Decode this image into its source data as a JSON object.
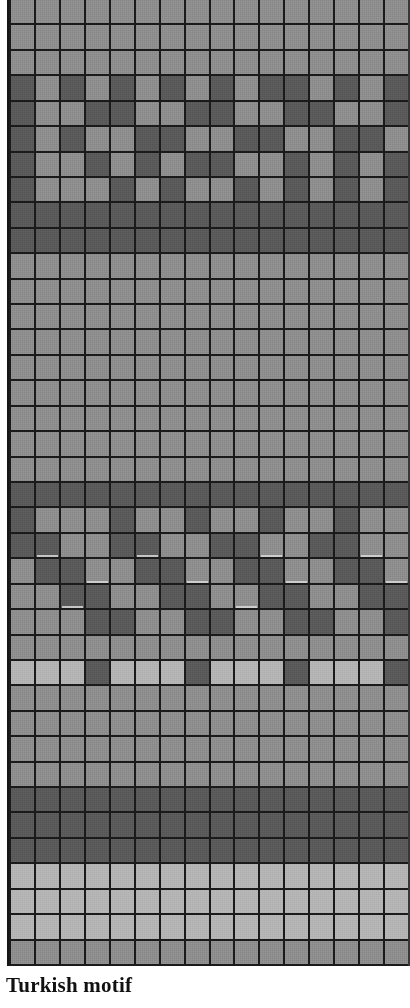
{
  "figure": {
    "caption": "Turkish motif",
    "kind": "knitting-colourwork-chart"
  },
  "chart_data": {
    "type": "heatmap",
    "title": "Turkish motif",
    "subtitle": "",
    "xlabel": "",
    "ylabel": "",
    "grid": true,
    "legend_position": "none",
    "columns": 16,
    "rows": 38,
    "cell_width_px": 25.2,
    "cell_height_px": 25.5,
    "grid_line_color": "#141414",
    "grid_line_width_px": 2,
    "value_labels": {
      "0": "light grey stitch",
      "1": "mid grey stitch",
      "2": "dark grey stitch"
    },
    "value_colors": {
      "0": "#b4b4b4",
      "1": "#8e8e8e",
      "2": "#5a5a5a"
    },
    "highlight_cells": [
      [
        21,
        1
      ],
      [
        21,
        5
      ],
      [
        21,
        10
      ],
      [
        21,
        14
      ],
      [
        22,
        3
      ],
      [
        22,
        7
      ],
      [
        22,
        11
      ],
      [
        22,
        15
      ],
      [
        23,
        2
      ],
      [
        23,
        9
      ]
    ],
    "row_bands": [
      {
        "from": 0,
        "to": 2,
        "name": "top plain mid band"
      },
      {
        "from": 3,
        "to": 8,
        "name": "upper chequer motif band"
      },
      {
        "from": 9,
        "to": 9,
        "name": "dark separator row"
      },
      {
        "from": 10,
        "to": 18,
        "name": "plain light field"
      },
      {
        "from": 19,
        "to": 24,
        "name": "lower stepped motif band"
      },
      {
        "from": 25,
        "to": 30,
        "name": "plain mid field"
      },
      {
        "from": 31,
        "to": 33,
        "name": "dark field"
      },
      {
        "from": 34,
        "to": 37,
        "name": "plain light base"
      }
    ],
    "matrix": [
      [
        1,
        1,
        1,
        1,
        1,
        1,
        1,
        1,
        1,
        1,
        1,
        1,
        1,
        1,
        1,
        1
      ],
      [
        1,
        1,
        1,
        1,
        1,
        1,
        1,
        1,
        1,
        1,
        1,
        1,
        1,
        1,
        1,
        1
      ],
      [
        1,
        1,
        1,
        1,
        1,
        1,
        1,
        1,
        1,
        1,
        1,
        1,
        1,
        1,
        1,
        1
      ],
      [
        2,
        1,
        2,
        1,
        2,
        1,
        2,
        1,
        2,
        1,
        2,
        2,
        1,
        2,
        1,
        2
      ],
      [
        2,
        1,
        1,
        2,
        2,
        1,
        1,
        2,
        2,
        1,
        1,
        2,
        2,
        1,
        1,
        2
      ],
      [
        2,
        1,
        2,
        1,
        1,
        2,
        2,
        1,
        1,
        2,
        2,
        1,
        1,
        2,
        2,
        1
      ],
      [
        2,
        1,
        1,
        2,
        1,
        2,
        1,
        2,
        2,
        1,
        1,
        2,
        1,
        2,
        1,
        2
      ],
      [
        2,
        1,
        1,
        1,
        2,
        1,
        2,
        1,
        1,
        2,
        1,
        2,
        1,
        2,
        1,
        2
      ],
      [
        2,
        2,
        2,
        2,
        2,
        2,
        2,
        2,
        2,
        2,
        2,
        2,
        2,
        2,
        2,
        2
      ],
      [
        2,
        2,
        2,
        2,
        2,
        2,
        2,
        2,
        2,
        2,
        2,
        2,
        2,
        2,
        2,
        2
      ],
      [
        1,
        1,
        1,
        1,
        1,
        1,
        1,
        1,
        1,
        1,
        1,
        1,
        1,
        1,
        1,
        1
      ],
      [
        1,
        1,
        1,
        1,
        1,
        1,
        1,
        1,
        1,
        1,
        1,
        1,
        1,
        1,
        1,
        1
      ],
      [
        1,
        1,
        1,
        1,
        1,
        1,
        1,
        1,
        1,
        1,
        1,
        1,
        1,
        1,
        1,
        1
      ],
      [
        1,
        1,
        1,
        1,
        1,
        1,
        1,
        1,
        1,
        1,
        1,
        1,
        1,
        1,
        1,
        1
      ],
      [
        1,
        1,
        1,
        1,
        1,
        1,
        1,
        1,
        1,
        1,
        1,
        1,
        1,
        1,
        1,
        1
      ],
      [
        1,
        1,
        1,
        1,
        1,
        1,
        1,
        1,
        1,
        1,
        1,
        1,
        1,
        1,
        1,
        1
      ],
      [
        1,
        1,
        1,
        1,
        1,
        1,
        1,
        1,
        1,
        1,
        1,
        1,
        1,
        1,
        1,
        1
      ],
      [
        1,
        1,
        1,
        1,
        1,
        1,
        1,
        1,
        1,
        1,
        1,
        1,
        1,
        1,
        1,
        1
      ],
      [
        1,
        1,
        1,
        1,
        1,
        1,
        1,
        1,
        1,
        1,
        1,
        1,
        1,
        1,
        1,
        1
      ],
      [
        2,
        2,
        2,
        2,
        2,
        2,
        2,
        2,
        2,
        2,
        2,
        2,
        2,
        2,
        2,
        2
      ],
      [
        2,
        1,
        1,
        1,
        2,
        1,
        1,
        2,
        1,
        1,
        2,
        1,
        1,
        2,
        1,
        1
      ],
      [
        2,
        2,
        1,
        1,
        2,
        2,
        1,
        1,
        2,
        2,
        1,
        1,
        2,
        2,
        1,
        1
      ],
      [
        1,
        2,
        2,
        1,
        1,
        2,
        2,
        1,
        1,
        2,
        2,
        1,
        1,
        2,
        2,
        1
      ],
      [
        1,
        1,
        2,
        2,
        1,
        1,
        2,
        2,
        1,
        1,
        2,
        2,
        1,
        1,
        2,
        2
      ],
      [
        1,
        1,
        1,
        2,
        2,
        1,
        1,
        2,
        2,
        1,
        1,
        2,
        2,
        1,
        1,
        2
      ],
      [
        1,
        1,
        1,
        1,
        1,
        1,
        1,
        1,
        1,
        1,
        1,
        1,
        1,
        1,
        1,
        1
      ],
      [
        0,
        0,
        0,
        2,
        0,
        0,
        0,
        2,
        0,
        0,
        0,
        2,
        0,
        0,
        0,
        2
      ],
      [
        1,
        1,
        1,
        1,
        1,
        1,
        1,
        1,
        1,
        1,
        1,
        1,
        1,
        1,
        1,
        1
      ],
      [
        1,
        1,
        1,
        1,
        1,
        1,
        1,
        1,
        1,
        1,
        1,
        1,
        1,
        1,
        1,
        1
      ],
      [
        1,
        1,
        1,
        1,
        1,
        1,
        1,
        1,
        1,
        1,
        1,
        1,
        1,
        1,
        1,
        1
      ],
      [
        1,
        1,
        1,
        1,
        1,
        1,
        1,
        1,
        1,
        1,
        1,
        1,
        1,
        1,
        1,
        1
      ],
      [
        2,
        2,
        2,
        2,
        2,
        2,
        2,
        2,
        2,
        2,
        2,
        2,
        2,
        2,
        2,
        2
      ],
      [
        2,
        2,
        2,
        2,
        2,
        2,
        2,
        2,
        2,
        2,
        2,
        2,
        2,
        2,
        2,
        2
      ],
      [
        2,
        2,
        2,
        2,
        2,
        2,
        2,
        2,
        2,
        2,
        2,
        2,
        2,
        2,
        2,
        2
      ],
      [
        0,
        0,
        0,
        0,
        0,
        0,
        0,
        0,
        0,
        0,
        0,
        0,
        0,
        0,
        0,
        0
      ],
      [
        0,
        0,
        0,
        0,
        0,
        0,
        0,
        0,
        0,
        0,
        0,
        0,
        0,
        0,
        0,
        0
      ],
      [
        0,
        0,
        0,
        0,
        0,
        0,
        0,
        0,
        0,
        0,
        0,
        0,
        0,
        0,
        0,
        0
      ],
      [
        1,
        1,
        1,
        1,
        1,
        1,
        1,
        1,
        1,
        1,
        1,
        1,
        1,
        1,
        1,
        1
      ]
    ]
  }
}
